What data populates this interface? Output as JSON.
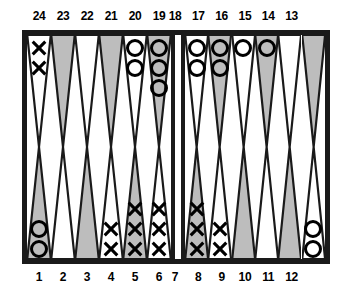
{
  "colors": {
    "frame": "#1a1a1a",
    "point_light": "#ffffff",
    "point_dark": "#bdbdbd",
    "outline": "#1a1a1a",
    "checker_o": "#000000",
    "checker_x": "#000000",
    "background": "#ffffff"
  },
  "labels": {
    "top_row": [
      "24",
      "23",
      "22",
      "21",
      "20",
      "19",
      "18",
      "17",
      "16",
      "15",
      "14",
      "13"
    ],
    "bottom_row": [
      "1",
      "2",
      "3",
      "4",
      "5",
      "6",
      "7",
      "8",
      "9",
      "10",
      "11",
      "12"
    ]
  },
  "chart_data": {
    "type": "diagram",
    "legend": [
      {
        "symbol": "X",
        "name": "X checker"
      },
      {
        "symbol": "O",
        "name": "O checker"
      }
    ],
    "points": [
      {
        "number": 24,
        "quadrant": "top-left",
        "shade": "light",
        "checker": "X",
        "count": 2
      },
      {
        "number": 23,
        "quadrant": "top-left",
        "shade": "dark",
        "checker": null,
        "count": 0
      },
      {
        "number": 22,
        "quadrant": "top-left",
        "shade": "light",
        "checker": null,
        "count": 0
      },
      {
        "number": 21,
        "quadrant": "top-left",
        "shade": "dark",
        "checker": null,
        "count": 0
      },
      {
        "number": 20,
        "quadrant": "top-left",
        "shade": "light",
        "checker": "O",
        "count": 2
      },
      {
        "number": 19,
        "quadrant": "top-left",
        "shade": "dark",
        "checker": "O",
        "count": 3
      },
      {
        "number": 18,
        "quadrant": "top-right",
        "shade": "light",
        "checker": "O",
        "count": 2
      },
      {
        "number": 17,
        "quadrant": "top-right",
        "shade": "dark",
        "checker": "O",
        "count": 2
      },
      {
        "number": 16,
        "quadrant": "top-right",
        "shade": "light",
        "checker": "O",
        "count": 1
      },
      {
        "number": 15,
        "quadrant": "top-right",
        "shade": "dark",
        "checker": "O",
        "count": 1
      },
      {
        "number": 14,
        "quadrant": "top-right",
        "shade": "light",
        "checker": null,
        "count": 0
      },
      {
        "number": 13,
        "quadrant": "top-right",
        "shade": "dark",
        "checker": null,
        "count": 0
      },
      {
        "number": 1,
        "quadrant": "bottom-left",
        "shade": "dark",
        "checker": "O",
        "count": 2
      },
      {
        "number": 2,
        "quadrant": "bottom-left",
        "shade": "light",
        "checker": null,
        "count": 0
      },
      {
        "number": 3,
        "quadrant": "bottom-left",
        "shade": "dark",
        "checker": null,
        "count": 0
      },
      {
        "number": 4,
        "quadrant": "bottom-left",
        "shade": "light",
        "checker": "X",
        "count": 2
      },
      {
        "number": 5,
        "quadrant": "bottom-left",
        "shade": "dark",
        "checker": "X",
        "count": 3
      },
      {
        "number": 6,
        "quadrant": "bottom-left",
        "shade": "light",
        "checker": "X",
        "count": 3
      },
      {
        "number": 7,
        "quadrant": "bottom-right",
        "shade": "dark",
        "checker": "X",
        "count": 3
      },
      {
        "number": 8,
        "quadrant": "bottom-right",
        "shade": "light",
        "checker": "X",
        "count": 2
      },
      {
        "number": 9,
        "quadrant": "bottom-right",
        "shade": "dark",
        "checker": null,
        "count": 0
      },
      {
        "number": 10,
        "quadrant": "bottom-right",
        "shade": "light",
        "checker": null,
        "count": 0
      },
      {
        "number": 11,
        "quadrant": "bottom-right",
        "shade": "dark",
        "checker": null,
        "count": 0
      },
      {
        "number": 12,
        "quadrant": "bottom-right",
        "shade": "light",
        "checker": "O",
        "count": 2
      }
    ],
    "bar": {
      "X": 0,
      "O": 0
    },
    "totals": {
      "X": 15,
      "O": 15
    }
  }
}
